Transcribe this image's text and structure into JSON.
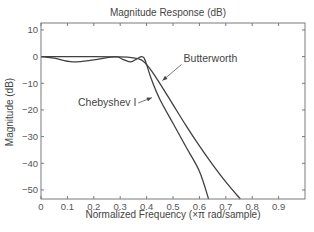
{
  "chart_data": {
    "type": "line",
    "title": "Magnitude Response (dB)",
    "xlabel": "Normalized Frequency (×π rad/sample)",
    "ylabel": "Magnitude (dB)",
    "xlim": [
      0,
      1
    ],
    "ylim": [
      -53.4,
      12.6
    ],
    "xticks": [
      0,
      0.1,
      0.2,
      0.3,
      0.4,
      0.5,
      0.6,
      0.7,
      0.8,
      0.9
    ],
    "xtick_labels": [
      "0",
      "0.1",
      "0.2",
      "0.3",
      "0.4",
      "0.5",
      "0.6",
      "0.7",
      "0.8",
      "0.9"
    ],
    "yticks": [
      10,
      0,
      -10,
      -20,
      -30,
      -40,
      -50
    ],
    "ytick_labels": [
      "10",
      "0",
      "−10",
      "−20",
      "−30",
      "−40",
      "−50"
    ],
    "grid": false,
    "legend": null,
    "series": [
      {
        "name": "Butterworth",
        "x": [
          0,
          0.1,
          0.2,
          0.3,
          0.35,
          0.38,
          0.4,
          0.42,
          0.45,
          0.5,
          0.55,
          0.6,
          0.65,
          0.7,
          0.755
        ],
        "y": [
          0,
          0,
          0,
          -0.1,
          -0.5,
          -1.2,
          -3,
          -5.5,
          -10,
          -18,
          -26,
          -33.5,
          -40.5,
          -47,
          -53.4
        ]
      },
      {
        "name": "Chebyshev I",
        "x": [
          0,
          0.05,
          0.12,
          0.2,
          0.28,
          0.31,
          0.34,
          0.36,
          0.38,
          0.39,
          0.4,
          0.42,
          0.45,
          0.5,
          0.55,
          0.6,
          0.635
        ],
        "y": [
          0,
          -0.6,
          -2,
          -1.2,
          0,
          -1,
          -2,
          -1,
          0,
          -0.5,
          -3,
          -9,
          -16,
          -25,
          -34,
          -43,
          -53.4
        ]
      }
    ],
    "annotations": [
      {
        "text": "Butterworth",
        "x": 0.54,
        "y": -2.2,
        "arrow_to": [
          0.46,
          -9
        ]
      },
      {
        "text": "Chebyshev I",
        "x": 0.14,
        "y": -18.5,
        "arrow_to": [
          0.42,
          -15.4
        ]
      }
    ]
  },
  "colors": {
    "line": "#404040",
    "axis": "#7a7a7a",
    "text": "#555555"
  }
}
